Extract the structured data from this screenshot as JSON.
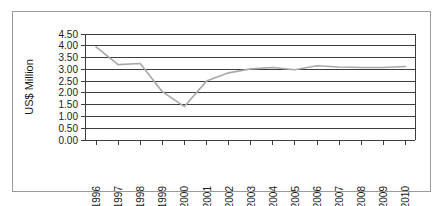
{
  "chart_data": {
    "type": "line",
    "title": "",
    "subtitle": "",
    "xlabel": "",
    "ylabel": "US$ Million",
    "categories": [
      "1996",
      "1997",
      "1998",
      "1999",
      "2000",
      "2001",
      "2002",
      "2003",
      "2004",
      "2005",
      "2006",
      "2007",
      "2008",
      "2009",
      "2010"
    ],
    "x": [
      1996,
      1997,
      1998,
      1999,
      2000,
      2001,
      2002,
      2003,
      2004,
      2005,
      2006,
      2007,
      2008,
      2009,
      2010
    ],
    "values": [
      3.95,
      3.2,
      3.25,
      2.05,
      1.42,
      2.5,
      2.85,
      3.02,
      3.08,
      2.98,
      3.15,
      3.1,
      3.08,
      3.08,
      3.12
    ],
    "series": [
      {
        "name": "US$ Million",
        "values": [
          3.95,
          3.2,
          3.25,
          2.05,
          1.42,
          2.5,
          2.85,
          3.02,
          3.08,
          2.98,
          3.15,
          3.1,
          3.08,
          3.08,
          3.12
        ],
        "color": "#a8a8a8"
      }
    ],
    "ylim": [
      0.0,
      4.5
    ],
    "yticks": [
      0.0,
      0.5,
      1.0,
      1.5,
      2.0,
      2.5,
      3.0,
      3.5,
      4.0,
      4.5
    ],
    "ytick_labels": [
      "0.00",
      "0.50",
      "1.00",
      "1.50",
      "2.00",
      "2.50",
      "3.00",
      "3.50",
      "4.00",
      "4.50"
    ],
    "grid": true,
    "grid_axis": "y",
    "legend": false,
    "legend_position": "none",
    "xtick_rotation": 90,
    "annotations": []
  },
  "figure": {
    "border_color": "#9a9a9a",
    "background_color": "#ffffff",
    "axis_color": "#3d3d3d",
    "line_color": "#a8a8a8"
  }
}
